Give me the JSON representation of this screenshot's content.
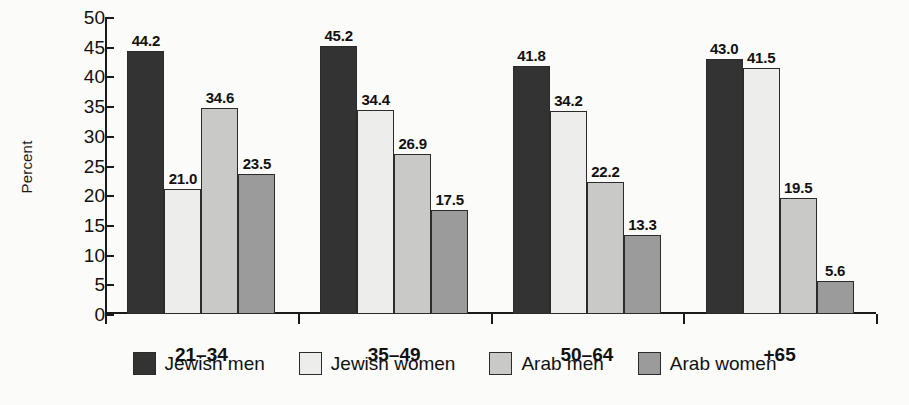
{
  "chart_data": {
    "type": "bar",
    "title": "",
    "xlabel": "",
    "ylabel": "Percent",
    "ylim": [
      0,
      50
    ],
    "yticks": [
      0,
      5,
      10,
      15,
      20,
      25,
      30,
      35,
      40,
      45,
      50
    ],
    "ytick_labels": [
      "0",
      "5",
      "10",
      "15",
      "20",
      "25",
      "30",
      "35",
      "40",
      "45",
      "50"
    ],
    "grid": false,
    "legend_position": "bottom",
    "categories": [
      "21–34",
      "35–49",
      "50–64",
      "+65"
    ],
    "series": [
      {
        "name": "Jewish men",
        "color": "#333333",
        "values": [
          44.2,
          45.2,
          41.8,
          43.0
        ],
        "labels": [
          "44.2",
          "45.2",
          "41.8",
          "43.0"
        ]
      },
      {
        "name": "Jewish women",
        "color": "#ededeb",
        "values": [
          21.0,
          34.4,
          34.2,
          41.5
        ],
        "labels": [
          "21.0",
          "34.4",
          "34.2",
          "41.5"
        ]
      },
      {
        "name": "Arab men",
        "color": "#c9c9c7",
        "values": [
          34.6,
          26.9,
          22.2,
          19.5
        ],
        "labels": [
          "34.6",
          "26.9",
          "22.2",
          "19.5"
        ]
      },
      {
        "name": "Arab women",
        "color": "#9b9b9b",
        "values": [
          23.5,
          17.5,
          13.3,
          5.6
        ],
        "labels": [
          "23.5",
          "17.5",
          "13.3",
          "5.6"
        ]
      }
    ]
  },
  "colors": {
    "background": "#fbfbf9",
    "axis": "#1a1a1a",
    "text": "#111111",
    "bar_border": "#2b2b2b"
  }
}
